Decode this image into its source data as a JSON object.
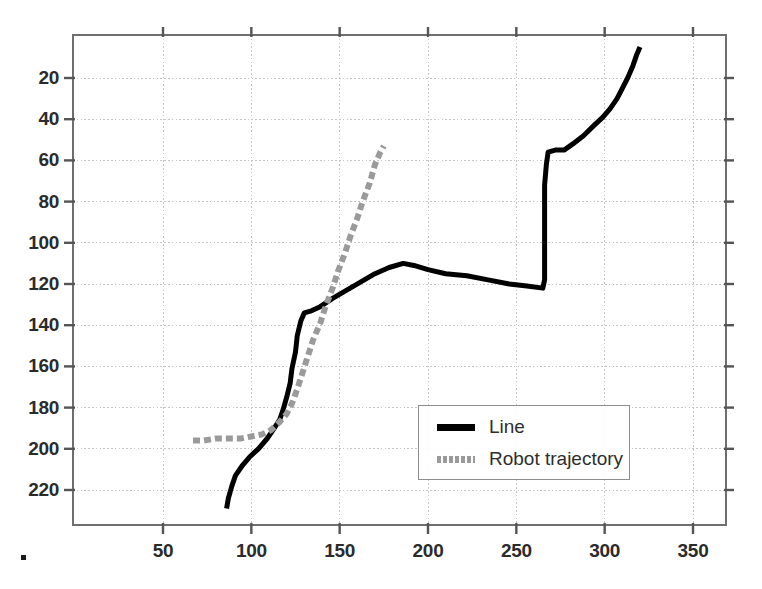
{
  "chart_data": {
    "type": "line",
    "title": "",
    "xlabel": "",
    "ylabel": "",
    "xlim": [
      0,
      367
    ],
    "ylim": [
      233,
      8
    ],
    "y_axis_inverted": true,
    "grid": true,
    "grid_style": "dotted",
    "xticks": [
      50,
      100,
      150,
      200,
      250,
      300,
      350
    ],
    "yticks": [
      20,
      40,
      60,
      80,
      100,
      120,
      140,
      160,
      180,
      200,
      220
    ],
    "xtick_labels": [
      "50",
      "100",
      "150",
      "200",
      "250",
      "300",
      "350"
    ],
    "ytick_labels": [
      "20",
      "40",
      "60",
      "80",
      "100",
      "120",
      "140",
      "160",
      "180",
      "200",
      "220"
    ],
    "legend_position": "center-right",
    "series": [
      {
        "name": "Line",
        "label": "Line",
        "color": "#000000",
        "style": "solid",
        "width": 5,
        "points": [
          [
            86,
            229
          ],
          [
            87,
            224
          ],
          [
            89,
            218
          ],
          [
            91,
            213
          ],
          [
            95,
            208
          ],
          [
            99,
            204
          ],
          [
            104,
            200
          ],
          [
            109,
            195
          ],
          [
            113,
            190
          ],
          [
            116,
            186
          ],
          [
            118,
            181
          ],
          [
            120,
            175
          ],
          [
            122,
            168
          ],
          [
            123,
            161
          ],
          [
            125,
            153
          ],
          [
            126,
            145
          ],
          [
            128,
            138
          ],
          [
            130,
            134
          ],
          [
            134,
            133
          ],
          [
            139,
            131
          ],
          [
            146,
            127
          ],
          [
            154,
            123
          ],
          [
            162,
            119
          ],
          [
            170,
            115
          ],
          [
            178,
            112
          ],
          [
            186,
            110
          ],
          [
            192,
            111
          ],
          [
            200,
            113
          ],
          [
            210,
            115
          ],
          [
            222,
            116
          ],
          [
            234,
            118
          ],
          [
            246,
            120
          ],
          [
            256,
            121
          ],
          [
            265,
            122
          ],
          [
            266,
            118
          ],
          [
            266,
            108
          ],
          [
            266,
            96
          ],
          [
            266,
            84
          ],
          [
            266,
            72
          ],
          [
            267,
            62
          ],
          [
            268,
            56
          ],
          [
            272,
            55
          ],
          [
            277,
            55
          ],
          [
            282,
            52
          ],
          [
            288,
            48
          ],
          [
            294,
            43
          ],
          [
            299,
            39
          ],
          [
            303,
            35
          ],
          [
            307,
            30
          ],
          [
            310,
            25
          ],
          [
            313,
            20
          ],
          [
            316,
            14
          ],
          [
            318,
            9
          ],
          [
            320,
            5
          ]
        ]
      },
      {
        "name": "Robot trajectory",
        "label": "Robot trajectory",
        "color": "#9a9a9a",
        "style": "dashed",
        "width": 6,
        "points": [
          [
            67,
            196
          ],
          [
            73,
            196
          ],
          [
            80,
            195
          ],
          [
            87,
            195
          ],
          [
            94,
            195
          ],
          [
            100,
            194
          ],
          [
            106,
            193
          ],
          [
            111,
            191
          ],
          [
            116,
            187
          ],
          [
            120,
            183
          ],
          [
            123,
            178
          ],
          [
            126,
            171
          ],
          [
            129,
            163
          ],
          [
            132,
            155
          ],
          [
            135,
            147
          ],
          [
            139,
            139
          ],
          [
            142,
            131
          ],
          [
            146,
            122
          ],
          [
            149,
            114
          ],
          [
            153,
            105
          ],
          [
            156,
            97
          ],
          [
            160,
            88
          ],
          [
            163,
            80
          ],
          [
            167,
            71
          ],
          [
            170,
            62
          ],
          [
            173,
            56
          ],
          [
            175,
            53
          ]
        ]
      }
    ]
  },
  "legend": {
    "entries": [
      {
        "label": "Line",
        "swatch": "solid",
        "color": "#000000"
      },
      {
        "label": "Robot trajectory",
        "swatch": "dashed",
        "color": "#9a9a9a"
      }
    ]
  },
  "axes": {
    "frame_color": "#6e6e6e",
    "grid_color": "#c4c4c4",
    "tick_color": "#555555",
    "label_color": "#2b2b2b"
  },
  "artifacts": {
    "corner_dot_visible": true
  }
}
